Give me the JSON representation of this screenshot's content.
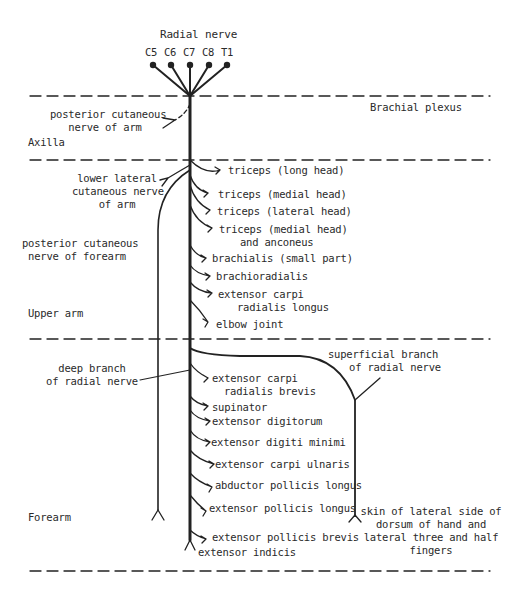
{
  "title": "Radial nerve",
  "roots": [
    "C5",
    "C6",
    "C7",
    "C8",
    "T1"
  ],
  "regions": {
    "brachial_plexus": "Brachial plexus",
    "axilla": "Axilla",
    "upper_arm": "Upper arm",
    "forearm": "Forearm"
  },
  "left_branches": {
    "posterior_cutaneous_arm": [
      "posterior cutaneous",
      "nerve of arm"
    ],
    "lower_lateral_cutaneous_arm": [
      "lower lateral",
      "cutaneous nerve",
      "of arm"
    ],
    "posterior_cutaneous_forearm": [
      "posterior cutaneous",
      "nerve of forearm"
    ],
    "deep_branch": [
      "deep branch",
      "of radial nerve"
    ]
  },
  "upper_arm_branches": [
    "triceps (long head)",
    "triceps (medial head)",
    "triceps (lateral head)",
    "triceps (medial head)",
    "and anconeus",
    "brachialis (small part)",
    "brachioradialis",
    "extensor carpi",
    "radialis longus",
    "elbow joint"
  ],
  "forearm_branches": [
    "extensor carpi",
    "radialis brevis",
    "supinator",
    "extensor digitorum",
    "extensor digiti minimi",
    "extensor carpi ulnaris",
    "abductor pollicis longus",
    "extensor pollicis longus",
    "extensor pollicis brevis",
    "extensor indicis"
  ],
  "superficial_branch": {
    "label": [
      "superficial branch",
      "of radial nerve"
    ],
    "target": [
      "skin of lateral side of",
      "dorsum of hand and",
      "lateral three and half",
      "fingers"
    ]
  }
}
